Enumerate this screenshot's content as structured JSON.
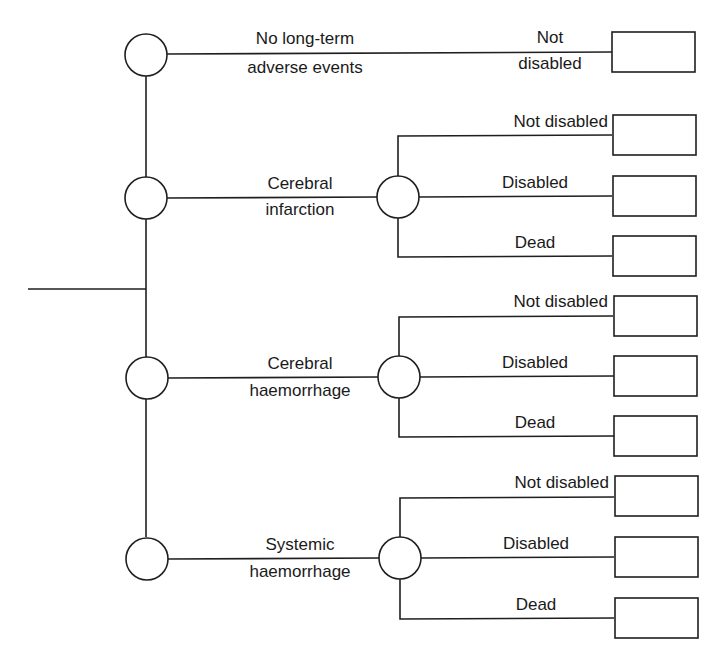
{
  "diagram": {
    "type": "decision-tree",
    "root": {
      "label": ""
    },
    "events": [
      {
        "label_line1": "No long-term",
        "label_line2": "adverse events",
        "outcome_line1": "Not",
        "outcome_line2": "disabled"
      },
      {
        "label_line1": "Cerebral",
        "label_line2": "infarction",
        "outcomes": [
          "Not disabled",
          "Disabled",
          "Dead"
        ]
      },
      {
        "label_line1": "Cerebral",
        "label_line2": "haemorrhage",
        "outcomes": [
          "Not disabled",
          "Disabled",
          "Dead"
        ]
      },
      {
        "label_line1": "Systemic",
        "label_line2": "haemorrhage",
        "outcomes": [
          "Not disabled",
          "Disabled",
          "Dead"
        ]
      }
    ],
    "colors": {
      "line": "#1f1f1f",
      "background": "#ffffff",
      "text": "#1a1a1a"
    }
  }
}
